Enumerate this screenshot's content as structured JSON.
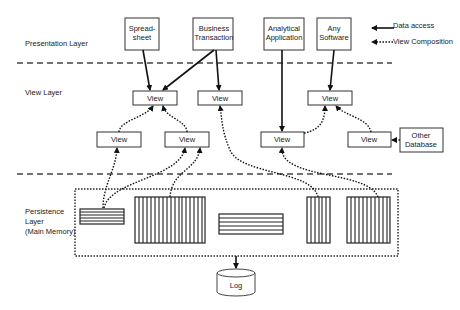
{
  "layers": {
    "presentation": "Presentation Layer",
    "view": "View Layer",
    "persistence_1": "Persistence",
    "persistence_2": "Layer",
    "persistence_3": "(Main Memory)"
  },
  "presentation_nodes": [
    {
      "line1": "Spread-",
      "line2": "sheet"
    },
    {
      "line1": "Business",
      "line2": "Transaction"
    },
    {
      "line1": "Analytical",
      "line2": "Application"
    },
    {
      "line1": "Any",
      "line2": "Software"
    }
  ],
  "view_label": "View",
  "other_db": {
    "line1": "Other",
    "line2": "Database"
  },
  "log_label": "Log",
  "legend": {
    "data_access": "Data access",
    "view_composition": "View Composition"
  }
}
